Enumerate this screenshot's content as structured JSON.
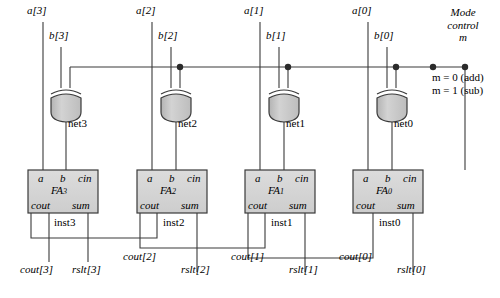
{
  "diagram": {
    "colors": {
      "wire": "#3a3a3a",
      "gate_fill": "#c9c9c9",
      "box_fill": "#d4d4d4",
      "text": "#000000",
      "background": "#ffffff"
    },
    "mode": {
      "line1": "Mode",
      "line2": "control",
      "line3": "m",
      "eq_add": "m = 0 (add)",
      "eq_sub": "m = 1 (sub)"
    },
    "bits": [
      {
        "a_label": "a[3]",
        "b_label": "b[3]",
        "net_label": "net3",
        "fa_name": "FA",
        "fa_sub": "3",
        "inst_label": "inst3",
        "cout_label": "cout[3]",
        "rslt_label": "rslt[3]"
      },
      {
        "a_label": "a[2]",
        "b_label": "b[2]",
        "net_label": "net2",
        "fa_name": "FA",
        "fa_sub": "2",
        "inst_label": "inst2",
        "cout_label": "cout[2]",
        "rslt_label": "rslt[2]"
      },
      {
        "a_label": "a[1]",
        "b_label": "b[1]",
        "net_label": "net1",
        "fa_name": "FA",
        "fa_sub": "1",
        "inst_label": "inst1",
        "cout_label": "cout[1]",
        "rslt_label": "rslt[1]"
      },
      {
        "a_label": "a[0]",
        "b_label": "b[0]",
        "net_label": "net0",
        "fa_name": "FA",
        "fa_sub": "0",
        "inst_label": "inst0",
        "cout_label": "cout[0]",
        "rslt_label": "rslt[0]"
      }
    ],
    "fa_ports": {
      "a": "a",
      "b": "b",
      "cin": "cin",
      "cout": "cout",
      "sum": "sum"
    }
  }
}
